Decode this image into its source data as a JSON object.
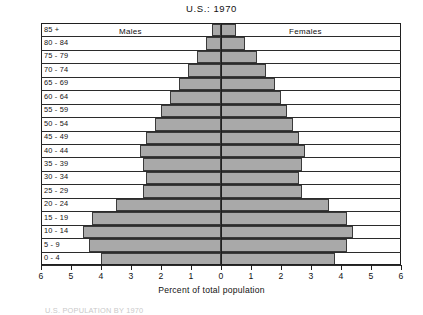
{
  "chart_data": {
    "type": "bar",
    "subtype": "population-pyramid",
    "title": "U.S.:  1970",
    "xlabel": "Percent of total population",
    "ylabel": "",
    "xlim": [
      -6,
      6
    ],
    "xticks": [
      "6",
      "5",
      "4",
      "3",
      "2",
      "1",
      "0",
      "1",
      "2",
      "3",
      "4",
      "5",
      "6"
    ],
    "xtick_values": [
      -6,
      -5,
      -4,
      -3,
      -2,
      -1,
      0,
      1,
      2,
      3,
      4,
      5,
      6
    ],
    "grid": true,
    "legend_position": "inside-top",
    "categories": [
      "85 +",
      "80 - 84",
      "75 - 79",
      "70 - 74",
      "65 - 69",
      "60 - 64",
      "55 - 59",
      "50 - 54",
      "45 - 49",
      "40 - 44",
      "35 - 39",
      "30 - 34",
      "25 - 29",
      "20 - 24",
      "15 - 19",
      "10 - 14",
      "5 - 9",
      "0 - 4"
    ],
    "series": [
      {
        "name": "Males",
        "side": "left",
        "values": [
          0.3,
          0.5,
          0.8,
          1.1,
          1.4,
          1.7,
          2.0,
          2.2,
          2.5,
          2.7,
          2.6,
          2.5,
          2.6,
          3.5,
          4.3,
          4.6,
          4.4,
          4.0
        ]
      },
      {
        "name": "Females",
        "side": "right",
        "values": [
          0.5,
          0.8,
          1.2,
          1.5,
          1.8,
          2.0,
          2.2,
          2.4,
          2.6,
          2.8,
          2.7,
          2.6,
          2.7,
          3.6,
          4.2,
          4.4,
          4.2,
          3.8
        ]
      }
    ]
  },
  "chart": {
    "title": "U.S.:  1970",
    "xaxis_title": "Percent of total population",
    "males_label": "Males",
    "females_label": "Females"
  },
  "caption": {
    "text": "U.S. POPULATION BY 1970"
  },
  "colors": {
    "bar_fill": "#a9a9a9",
    "bar_stroke": "#3a3a3a",
    "axis": "#1f1f1f",
    "text": "#121212",
    "background": "#ffffff"
  }
}
